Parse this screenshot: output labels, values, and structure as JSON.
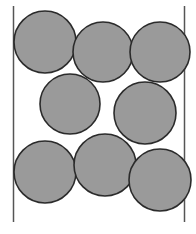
{
  "figure": {
    "width": 196,
    "height": 234,
    "background_color": "#ffffff"
  },
  "style": {
    "circle_fill": "#9a9a9a",
    "circle_stroke": "#2b2b2b",
    "circle_stroke_width": 1.6,
    "wall_stroke": "#555555",
    "wall_stroke_width": 1.5
  },
  "walls": [
    {
      "id": "left-wall",
      "label": "left wall",
      "x": 13.5,
      "y1": 6,
      "y2": 222
    },
    {
      "id": "right-wall",
      "label": "right wall",
      "x": 184.5,
      "y1": 6,
      "y2": 222
    }
  ],
  "chart_data": {
    "type": "scatter",
    "xlabel": "",
    "ylabel": "",
    "xlim": [
      0,
      196
    ],
    "ylim": [
      0,
      234
    ],
    "grid": false,
    "legend": "none",
    "count": 8,
    "radius": 30.5,
    "series": [
      {
        "name": "spheres",
        "points": [
          {
            "id": "sphere-1",
            "row": "top",
            "cx": 45,
            "cy": 42,
            "r": 31
          },
          {
            "id": "sphere-2",
            "row": "top",
            "cx": 103,
            "cy": 52,
            "r": 30
          },
          {
            "id": "sphere-3",
            "row": "top",
            "cx": 160,
            "cy": 52,
            "r": 30
          },
          {
            "id": "sphere-4",
            "row": "middle",
            "cx": 70,
            "cy": 104,
            "r": 30
          },
          {
            "id": "sphere-5",
            "row": "middle",
            "cx": 145,
            "cy": 113,
            "r": 31
          },
          {
            "id": "sphere-6",
            "row": "bottom",
            "cx": 45,
            "cy": 172,
            "r": 31
          },
          {
            "id": "sphere-7",
            "row": "bottom",
            "cx": 105,
            "cy": 165,
            "r": 31
          },
          {
            "id": "sphere-8",
            "row": "bottom",
            "cx": 160,
            "cy": 180,
            "r": 31
          }
        ]
      }
    ]
  }
}
